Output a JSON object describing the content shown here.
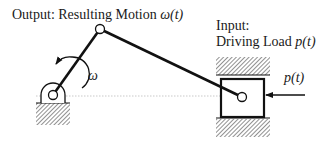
{
  "title": {
    "output_prefix": "Output: Resulting Motion ",
    "output_symbol": "ω(t)",
    "input_line1": "Input:",
    "input_line2_prefix": "Driving Load ",
    "input_line2_symbol": "p(t)"
  },
  "labels": {
    "omega": "ω",
    "force": "p(t)"
  },
  "mechanism": {
    "type": "slider-crank",
    "fixed_pivot": {
      "x": 53,
      "y": 95
    },
    "crank_joint": {
      "x": 100,
      "y": 29
    },
    "slider_pin": {
      "x": 242,
      "y": 97
    },
    "slider_block": {
      "x": 221,
      "y": 79,
      "w": 43,
      "h": 38
    },
    "guide_top_hatch": {
      "x": 216,
      "y": 57,
      "w": 54,
      "h": 18
    },
    "guide_bottom_hatch": {
      "x": 216,
      "y": 118,
      "w": 54,
      "h": 19
    },
    "ground_hatch": {
      "x": 36,
      "y": 103,
      "w": 34,
      "h": 22
    },
    "centerline_y": 96
  },
  "colors": {
    "stroke": "#111111",
    "hatch": "#555555",
    "centerline": "#bbbbbb",
    "text": "#1a1a1a"
  }
}
